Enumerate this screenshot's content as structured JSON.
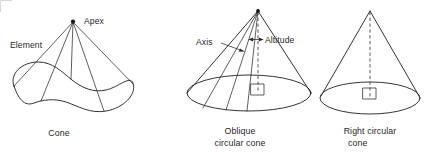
{
  "figure": {
    "width": 429,
    "height": 154,
    "background_color": "#ffffff",
    "line_color": "#1d1d1d",
    "text_color": "#1f1f1f",
    "frame_color": "#d8d8d8"
  },
  "diagram_data": {
    "type": "diagram",
    "subject": "Types of cones",
    "panel_count": 3,
    "panels": [
      {
        "id": "general-cone",
        "caption": "Cone",
        "base_shape": "irregular closed curve",
        "apex_marked": true,
        "has_altitude": false,
        "has_right_angle_marker": false,
        "element_line_count": 5,
        "labels": [
          {
            "name": "apex",
            "text": "Apex"
          },
          {
            "name": "element",
            "text": "Element"
          }
        ]
      },
      {
        "id": "oblique-circular-cone",
        "caption_line_1": "Oblique",
        "caption_line_2": "circular cone",
        "base_shape": "ellipse",
        "apex_marked": true,
        "has_altitude": true,
        "altitude_style": "dashed",
        "has_right_angle_marker": true,
        "element_line_count": 5,
        "labels": [
          {
            "name": "axis",
            "text": "Axis"
          },
          {
            "name": "altitude",
            "text": "Altitude"
          }
        ]
      },
      {
        "id": "right-circular-cone",
        "caption_line_1": "Right circular",
        "caption_line_2": "cone",
        "base_shape": "ellipse",
        "apex_marked": false,
        "has_altitude": true,
        "altitude_style": "dashed",
        "has_right_angle_marker": true,
        "element_line_count": 2,
        "labels": []
      }
    ]
  },
  "labels": {
    "apex": "Apex",
    "element": "Element",
    "axis": "Axis",
    "altitude": "Altitude"
  },
  "captions": {
    "cone": "Cone",
    "oblique_line1": "Oblique",
    "oblique_line2": "circular cone",
    "right_line1": "Right circular",
    "right_line2": "cone"
  }
}
